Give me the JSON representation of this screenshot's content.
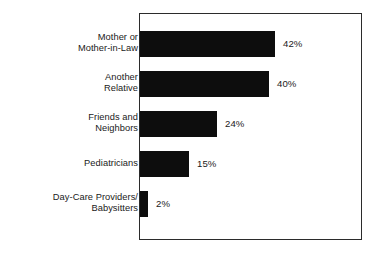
{
  "chart_data": {
    "type": "bar",
    "orientation": "horizontal",
    "title": "",
    "subtitle": "",
    "xlabel": "",
    "ylabel": "",
    "grid": false,
    "legend": false,
    "axis_ticks": [],
    "xlim": [
      0,
      70
    ],
    "value_suffix": "%",
    "categories": [
      "Mother or\nMother-in-Law",
      "Another\nRelative",
      "Friends and\nNeighbors",
      "Pediatricians",
      "Day-Care Providers/\nBabysitters"
    ],
    "values": [
      42,
      40,
      24,
      15,
      2
    ],
    "value_labels": [
      "42%",
      "40%",
      "24%",
      "15%",
      "2%"
    ],
    "bar_color": "#0d0d0d",
    "frame_color": "#2b2b2b",
    "background_color": "#ffffff"
  },
  "rows": [
    {
      "category": "Mother or\nMother-in-Law",
      "value": 42,
      "value_label": "42%",
      "top": 31,
      "bar_width": 135,
      "label_top": 32
    },
    {
      "category": "Another\nRelative",
      "value": 40,
      "value_label": "40%",
      "top": 71,
      "bar_width": 129,
      "label_top": 72
    },
    {
      "category": "Friends and\nNeighbors",
      "value": 24,
      "value_label": "24%",
      "top": 111,
      "bar_width": 77,
      "label_top": 112
    },
    {
      "category": "Pediatricians",
      "value": 15,
      "value_label": "15%",
      "top": 151,
      "bar_width": 49,
      "label_top": 158
    },
    {
      "category": "Day-Care Providers/\nBabysitters",
      "value": 2,
      "value_label": "2%",
      "top": 191,
      "bar_width": 8,
      "label_top": 192
    }
  ]
}
